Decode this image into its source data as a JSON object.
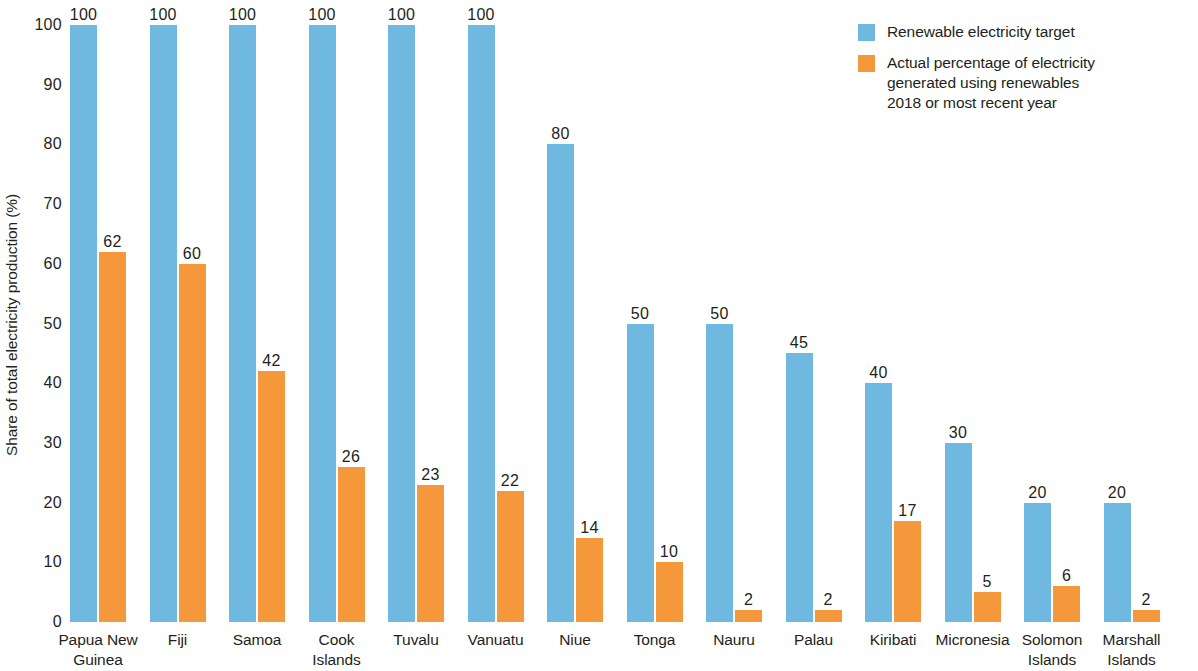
{
  "chart_data": {
    "type": "bar",
    "title": "",
    "xlabel": "",
    "ylabel": "Share of total electricity production (%)",
    "ylim": [
      0,
      100
    ],
    "ytick_labels": [
      "100",
      "90",
      "80",
      "70",
      "60",
      "50",
      "40",
      "30",
      "20",
      "10",
      "0"
    ],
    "yticks": [
      100,
      90,
      80,
      70,
      60,
      50,
      40,
      30,
      20,
      10,
      0
    ],
    "grid": false,
    "legend_position": "top-right",
    "categories": [
      "Papua New Guinea",
      "Fiji",
      "Samoa",
      "Cook Islands",
      "Tuvalu",
      "Vanuatu",
      "Niue",
      "Tonga",
      "Nauru",
      "Palau",
      "Kiribati",
      "Micronesia",
      "Solomon Islands",
      "Marshall Islands"
    ],
    "category_lines": [
      [
        "Papua New",
        "Guinea"
      ],
      [
        "Fiji"
      ],
      [
        "Samoa"
      ],
      [
        "Cook",
        "Islands"
      ],
      [
        "Tuvalu"
      ],
      [
        "Vanuatu"
      ],
      [
        "Niue"
      ],
      [
        "Tonga"
      ],
      [
        "Nauru"
      ],
      [
        "Palau"
      ],
      [
        "Kiribati"
      ],
      [
        "Micronesia"
      ],
      [
        "Solomon",
        "Islands"
      ],
      [
        "Marshall",
        "Islands"
      ]
    ],
    "series": [
      {
        "name": "Renewable electricity target",
        "color": "#6FB8E0",
        "values": [
          100,
          100,
          100,
          100,
          100,
          100,
          80,
          50,
          50,
          45,
          40,
          30,
          20,
          20
        ],
        "labels": [
          "100",
          "100",
          "100",
          "100",
          "100",
          "100",
          "80",
          "50",
          "50",
          "45",
          "40",
          "30",
          "20",
          "20"
        ]
      },
      {
        "name": "Actual percentage of electricity generated using renewables 2018 or most recent year",
        "color": "#F5983C",
        "values": [
          62,
          60,
          42,
          26,
          23,
          22,
          14,
          10,
          2,
          2,
          17,
          5,
          6,
          2
        ],
        "labels": [
          "62",
          "60",
          "42",
          "26",
          "23",
          "22",
          "14",
          "10",
          "2",
          "2",
          "17",
          "5",
          "6",
          "2"
        ]
      }
    ]
  },
  "legend": {
    "items": [
      {
        "color": "#6FB8E0",
        "lines": [
          "Renewable electricity target"
        ]
      },
      {
        "color": "#F5983C",
        "lines": [
          "Actual percentage of electricity",
          "generated using renewables",
          "2018 or most recent year"
        ]
      }
    ]
  }
}
